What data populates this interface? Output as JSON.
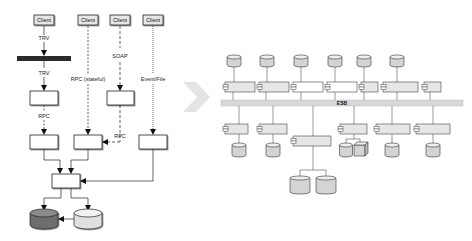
{
  "left_diagram": {
    "clients": [
      {
        "label": "Client"
      },
      {
        "label": "Client"
      },
      {
        "label": "Client"
      },
      {
        "label": "Client"
      }
    ],
    "protocols": {
      "trv_top": "TRV",
      "trv_bottom": "TRV",
      "rpc_left": "RPC",
      "rpc_stateful": "RPC (stateful)",
      "soap": "SOAP",
      "rpc_right": "RPC",
      "event_file": "Event/File"
    },
    "colors": {
      "bus_bar": "#2b2b2b",
      "db_dark": "#6e6e6e",
      "db_light": "#e0e0e0"
    }
  },
  "transition_arrow": {
    "icon": "chevron-right-arrow",
    "color": "#e4e4e4"
  },
  "right_diagram": {
    "bus_label": "ESB",
    "top_components": 7,
    "bottom_components": 7,
    "colors": {
      "bus": "#d9d9d9",
      "component_fill": "#e6e6e6",
      "component_fill_white": "#ffffff",
      "db_fill": "#d4d4d4"
    }
  }
}
